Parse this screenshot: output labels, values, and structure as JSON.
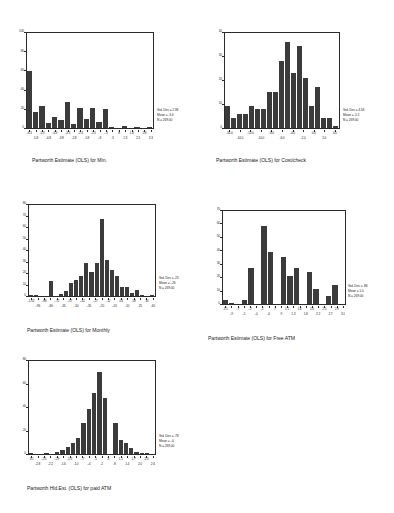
{
  "page": {
    "background": "#ffffff",
    "bar_color": "#3b3b3b",
    "axis_color": "#2b2b2b"
  },
  "chart_data": [
    {
      "id": "min",
      "type": "bar",
      "title": "Partworth Estimate (OLS) for Min.",
      "xlabel": "",
      "ylabel": "",
      "ylim": [
        0,
        100
      ],
      "yticks": [
        "0",
        "20",
        "40",
        "60",
        "80",
        "100"
      ],
      "ytick_values": [
        0,
        20,
        40,
        60,
        80,
        100
      ],
      "grid": false,
      "legend": "none",
      "xtick_labels_top": [
        "-6.3",
        "-5.3",
        "-4.3",
        "-3.3",
        "-2.3",
        "-1.3",
        "-.3",
        ".8",
        "1.8",
        "2.8"
      ],
      "xtick_labels_bottom": [
        "-5.8",
        "-4.8",
        "-3.8",
        "-2.8",
        "-1.8",
        "-.8",
        ".3",
        "1.3",
        "2.3",
        "3.3"
      ],
      "values": [
        59,
        17,
        23,
        5,
        11,
        8,
        27,
        4,
        21,
        9,
        21,
        6,
        20,
        1,
        0,
        2,
        0,
        1,
        0,
        1
      ],
      "stats": {
        "std_dev": "Std. Dev = 2.38",
        "mean": "Mean = -3.4",
        "n": "N = 269.00"
      }
    },
    {
      "id": "cost-check",
      "type": "bar",
      "title": "Partworth Estimate (OLS) for Cost/check",
      "xlabel": "",
      "ylabel": "",
      "ylim": [
        0,
        40
      ],
      "yticks": [
        "0",
        "10",
        "20",
        "30",
        "40"
      ],
      "ytick_values": [
        0,
        10,
        20,
        30,
        40
      ],
      "grid": false,
      "legend": "none",
      "xtick_labels_top": [
        "-16.0",
        "-12.0",
        "-8.0",
        "-4.0",
        "0.0",
        "4.0"
      ],
      "xtick_labels_bottom": [
        "-14.0",
        "-10.0",
        "-6.0",
        "-2.0",
        "2.0"
      ],
      "values": [
        9,
        4,
        6,
        6,
        9,
        8,
        8,
        15,
        15,
        28,
        36,
        23,
        34,
        21,
        9,
        17,
        4,
        4,
        1
      ],
      "stats": {
        "std_dev": "Std. Dev = 4.58",
        "mean": "Mean = -5.1",
        "n": "N = 269.00"
      }
    },
    {
      "id": "monthly",
      "type": "bar",
      "title": "Partworth Estimate (OLS) for Monthly",
      "xlabel": "",
      "ylabel": "",
      "ylim": [
        0,
        80
      ],
      "yticks": [
        "0",
        "10",
        "20",
        "30",
        "40",
        "50",
        "60",
        "70",
        "80"
      ],
      "ytick_values": [
        0,
        10,
        20,
        30,
        40,
        50,
        60,
        70,
        80
      ],
      "grid": false,
      "legend": "none",
      "xtick_labels_top": [
        "-1.02",
        "-.88",
        "-.72",
        "-.57",
        "-.42",
        "-.27",
        "-.12",
        ".03",
        ".18",
        ".33"
      ],
      "xtick_labels_bottom": [
        "-.96",
        "-.80",
        "-.65",
        "-.50",
        "-.35",
        "-.20",
        "-.05",
        ".10",
        ".25",
        ".40"
      ],
      "values": [
        1,
        1,
        0,
        0,
        13,
        0,
        2,
        4,
        11,
        14,
        17,
        29,
        21,
        29,
        67,
        31,
        23,
        17,
        8,
        8,
        3,
        5,
        1,
        0,
        1
      ],
      "stats": {
        "std_dev": "Std. Dev = .23",
        "mean": "Mean = -.26",
        "n": "N = 269.00"
      }
    },
    {
      "id": "free-atm",
      "type": "bar",
      "title": "Partworth Estimate (OLS) for Free ATM",
      "xlabel": "",
      "ylabel": "",
      "ylim": [
        0,
        70
      ],
      "yticks": [
        "0",
        "10",
        "20",
        "30",
        "40",
        "50",
        "60",
        "70"
      ],
      "ytick_values": [
        0,
        10,
        20,
        30,
        40,
        50,
        60,
        70
      ],
      "grid": false,
      "legend": "none",
      "xtick_labels_top": [
        "-1.5",
        "-.7",
        "-.2",
        ".2",
        ".7",
        "1.1",
        "1.6",
        "2.0",
        "2.5",
        "2.9"
      ],
      "xtick_labels_bottom": [
        "-.9",
        "-.5",
        "-.0",
        ".4",
        ".9",
        "1.3",
        "1.8",
        "2.2",
        "2.7",
        "3.1"
      ],
      "values": [
        3,
        1,
        0,
        3,
        27,
        0,
        58,
        39,
        0,
        35,
        21,
        27,
        0,
        24,
        11,
        0,
        6,
        14,
        0
      ],
      "stats": {
        "std_dev": "Std. Dev = .86",
        "mean": "Mean = 1.0",
        "n": "N = 269.00"
      }
    },
    {
      "id": "paid-atm",
      "type": "bar",
      "title": "Partworth Hld.Est. (OLS) for paid ATM",
      "xlabel": "",
      "ylabel": "",
      "ylim": [
        0,
        80
      ],
      "yticks": [
        "0",
        "20",
        "40",
        "60",
        "80"
      ],
      "ytick_values": [
        0,
        20,
        40,
        60,
        80
      ],
      "grid": false,
      "legend": "none",
      "xtick_labels_top": [
        "-3.1",
        "-2.5",
        "-1.9",
        "-1.3",
        "-.7",
        "-.1",
        ".5",
        "1.1",
        "1.7",
        "2.3"
      ],
      "xtick_labels_bottom": [
        "-2.8",
        "-2.2",
        "-1.6",
        "-1.0",
        "-.4",
        ".2",
        ".8",
        "1.4",
        "2.0",
        "2.6"
      ],
      "values": [
        1,
        0,
        0,
        1,
        0,
        2,
        3,
        6,
        9,
        14,
        26,
        38,
        52,
        70,
        48,
        0,
        26,
        12,
        9,
        5,
        2,
        1,
        1,
        0
      ],
      "stats": {
        "std_dev": "Std. Dev = .78",
        "mean": "Mean = -.0",
        "n": "N = 269.00"
      }
    }
  ]
}
